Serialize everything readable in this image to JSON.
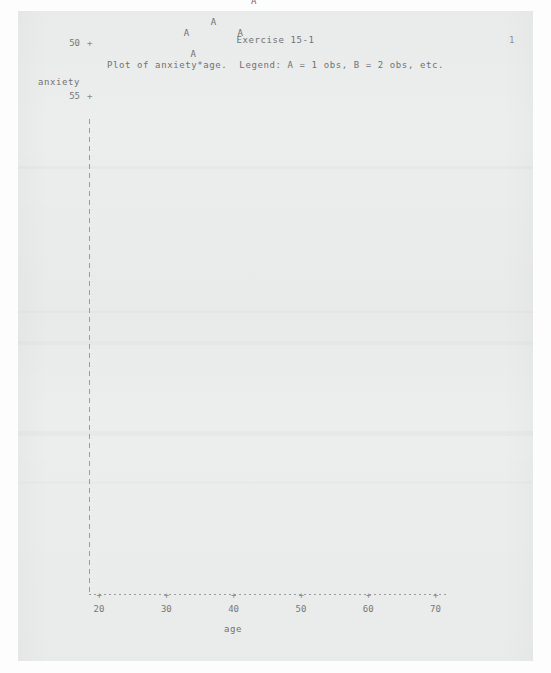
{
  "report": {
    "title": "Exercise 15-1",
    "page_number": "1",
    "subtitle": "Plot of anxiety*age.  Legend: A = 1 obs, B = 2 obs, etc.",
    "marker_glyph": "A"
  },
  "colors": {
    "paper": "#eceded",
    "ink": "#74767a",
    "axis": "#9a9c9d",
    "page_background": "#ffffff"
  },
  "chart_data": {
    "type": "scatter",
    "title": "Exercise 15-1",
    "subtitle": "Plot of anxiety*age.  Legend: A = 1 obs, B = 2 obs, etc.",
    "xlabel": "age",
    "ylabel": "anxiety",
    "xlim": [
      17,
      72
    ],
    "ylim": [
      8,
      57
    ],
    "xticks": [
      20,
      30,
      40,
      50,
      60,
      70
    ],
    "yticks": [
      10,
      15,
      20,
      25,
      30,
      35,
      40,
      45,
      50,
      55
    ],
    "grid": false,
    "legend": "A = 1 obs, B = 2 obs, etc.",
    "marker_labels": [
      "A"
    ],
    "points": [
      {
        "label": "A",
        "age": 22,
        "anxiety": 14
      },
      {
        "label": "A",
        "age": 25,
        "anxiety": 25
      },
      {
        "label": "A",
        "age": 25,
        "anxiety": 36
      },
      {
        "label": "A",
        "age": 27,
        "anxiety": 38
      },
      {
        "label": "A",
        "age": 31,
        "anxiety": 43
      },
      {
        "label": "A",
        "age": 33,
        "anxiety": 49
      },
      {
        "label": "A",
        "age": 34,
        "anxiety": 51
      },
      {
        "label": "A",
        "age": 37,
        "anxiety": 48
      },
      {
        "label": "A",
        "age": 41,
        "anxiety": 49
      },
      {
        "label": "A",
        "age": 43,
        "anxiety": 46
      },
      {
        "label": "A",
        "age": 44,
        "anxiety": 45
      },
      {
        "label": "A",
        "age": 47,
        "anxiety": 39
      },
      {
        "label": "A",
        "age": 51,
        "anxiety": 41
      },
      {
        "label": "A",
        "age": 53,
        "anxiety": 40
      },
      {
        "label": "A",
        "age": 56,
        "anxiety": 37
      },
      {
        "label": "A",
        "age": 57,
        "anxiety": 31
      },
      {
        "label": "A",
        "age": 62,
        "anxiety": 32
      },
      {
        "label": "A",
        "age": 65,
        "anxiety": 29
      },
      {
        "label": "A",
        "age": 66,
        "anxiety": 25
      },
      {
        "label": "A",
        "age": 67,
        "anxiety": 18
      }
    ]
  }
}
